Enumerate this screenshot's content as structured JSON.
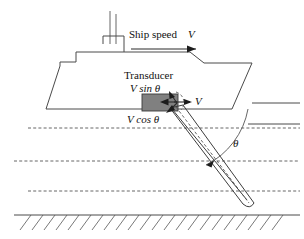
{
  "figure": {
    "background_color": "#ffffff",
    "line_color": "#4a4a4a",
    "transducer_color": "#808080",
    "text_color": "#111111"
  },
  "labels": {
    "ship_speed": "Ship speed",
    "ship_speed_symbol": "V",
    "transducer": "Transducer",
    "v_sin_theta": "V sin θ",
    "v_cos_theta": "V cos θ",
    "v_vector": "V",
    "theta": "θ"
  },
  "elements": {
    "ship_hull": "ship-hull-outline",
    "superstructure": "ship-superstructure",
    "masts": "ship-masts",
    "transducer_box": "transducer-block",
    "sonar_beam": "sonar-beam-cone",
    "beam_axis": "beam-center-axis",
    "sea_surface": "sea-surface-line",
    "water_layers": "water-layer-dashed-lines",
    "seafloor": "seafloor-line",
    "seafloor_hatching": "seafloor-hatching",
    "angle_arc": "theta-angle-arc",
    "speed_arrow": "ship-speed-arrow",
    "velocity_vector": "velocity-vector-arrow",
    "sin_component": "v-sin-theta-component-arrow",
    "cos_component": "v-cos-theta-component-arrow"
  },
  "geometry": {
    "water_layer_count": 3,
    "water_layer_y": [
      128,
      161,
      191
    ],
    "seafloor_y": 215,
    "sea_surface_y": 124,
    "beam_angle_deg": 30
  }
}
